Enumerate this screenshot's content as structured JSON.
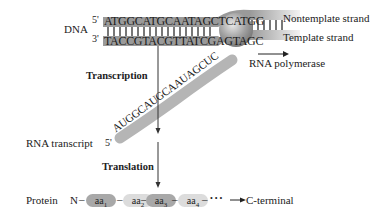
{
  "dna": {
    "label": "DNA",
    "five_prime": "5'",
    "three_prime": "3'",
    "top_strand": "ATGGCATGCAATAGCTCATGG",
    "bottom_strand": "TACCGTACGTTATCGAGTAGC",
    "nontemplate_label": "Nontemplate strand",
    "template_label": "Template strand"
  },
  "polymerase": {
    "label": "RNA polymerase",
    "color": "#9a9a9a"
  },
  "transcription": {
    "label": "Transcription"
  },
  "rna": {
    "label": "RNA transcript",
    "five_prime": "5'",
    "sequence": "AUGGCAUGCAAUAGCUC"
  },
  "translation": {
    "label": "Translation"
  },
  "protein": {
    "label": "Protein",
    "n_terminal": "N",
    "residues": [
      {
        "label": "aa",
        "sub": "1",
        "color": "#a8a8a8"
      },
      {
        "label": "aa",
        "sub": "2",
        "color": "#dcdcdc"
      },
      {
        "label": "aa",
        "sub": "3",
        "color": "#a8a8a8"
      },
      {
        "label": "aa",
        "sub": "4",
        "color": "#dcdcdc"
      }
    ],
    "dots": "• • •",
    "c_terminal": "C-terminal"
  }
}
